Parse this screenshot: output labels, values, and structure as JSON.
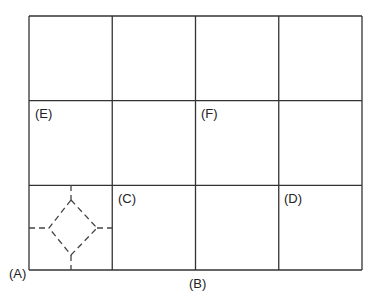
{
  "diagram": {
    "grid": {
      "columns": 4,
      "rows": 3,
      "line_color": "#333333"
    },
    "labels": {
      "A": "(A)",
      "B": "(B)",
      "C": "(C)",
      "D": "(D)",
      "E": "(E)",
      "F": "(F)"
    },
    "dashed_shape": {
      "type": "diamond",
      "cell": "bottom-left",
      "style": "dashed"
    }
  }
}
